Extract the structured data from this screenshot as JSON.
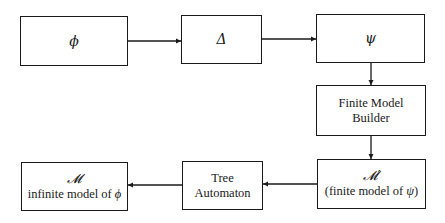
{
  "diagram": {
    "type": "flowchart",
    "nodes": [
      {
        "id": "phi",
        "symbol": "ϕ"
      },
      {
        "id": "delta",
        "symbol": "Δ"
      },
      {
        "id": "psi",
        "symbol": "ψ"
      },
      {
        "id": "fmb",
        "line1": "Finite Model",
        "line2": "Builder"
      },
      {
        "id": "mprime",
        "symbol": "𝓜′",
        "text_pre": "(finite model of ",
        "text_sym": "ψ",
        "text_post": ")"
      },
      {
        "id": "tree",
        "line1": "Tree",
        "line2": "Automaton"
      },
      {
        "id": "m",
        "symbol": "𝓜",
        "text_pre": "infinite model of ",
        "text_sym": "ϕ"
      }
    ],
    "edges": [
      {
        "from": "phi",
        "to": "delta"
      },
      {
        "from": "delta",
        "to": "psi"
      },
      {
        "from": "psi",
        "to": "fmb"
      },
      {
        "from": "fmb",
        "to": "mprime"
      },
      {
        "from": "mprime",
        "to": "tree"
      },
      {
        "from": "tree",
        "to": "m"
      }
    ],
    "colors": {
      "stroke": "#1a1a1a",
      "background": "#ffffff"
    }
  }
}
